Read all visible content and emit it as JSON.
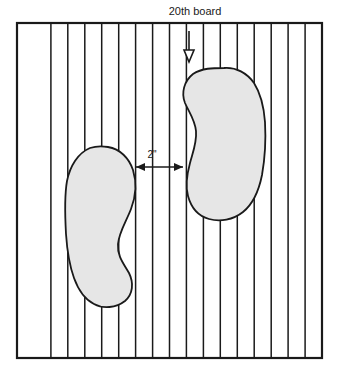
{
  "diagram": {
    "title_label": "20th board",
    "dimension_label": "2\"",
    "colors": {
      "footprint_fill": "#e6e6e6",
      "footprint_stroke": "#1a1a1a",
      "board_line": "#1a1a1a",
      "frame": "#1a1a1a",
      "background": "#ffffff",
      "text": "#1a1a1a"
    },
    "floor": {
      "name": "board-floor",
      "frame": {
        "x": 17,
        "y": 23,
        "width": 305,
        "height": 335
      },
      "board_count": 18,
      "divider_count": 17,
      "board_width": 16.94,
      "divider_x": [
        33.9,
        50.8,
        67.8,
        84.7,
        101.7,
        118.6,
        135.6,
        152.5,
        169.4,
        186.4,
        203.3,
        220.3,
        237.2,
        254.2,
        271.1,
        288.1,
        305.0
      ]
    },
    "callout_arrow": {
      "name": "twentieth-board-pointer",
      "x": 189,
      "y_start": 31,
      "y_end": 62,
      "head_width": 10,
      "head_height": 12
    },
    "title_text_pos": {
      "x": 195,
      "y": 15
    },
    "dimension": {
      "name": "gap-dimension",
      "y": 167,
      "x_left": 136,
      "x_right": 183,
      "label_x": 152,
      "label_y": 158
    },
    "footprints": [
      {
        "name": "left-footprint",
        "foot": "left",
        "path": "M 108 147 C 120 149 129 158 133 170 C 137 183 136 196 131 209 C 126 222 119 232 118 244 C 117 256 124 264 129 273 C 134 283 133 294 125 301 C 116 308 103 309 94 304 C 84 299 78 289 74 278 C 69 264 67 249 66 234 C 65 216 64 198 67 181 C 70 166 78 153 90 148 C 96 146 102 146 108 147 Z"
      },
      {
        "name": "right-footprint",
        "foot": "right",
        "path": "M 224 68 C 236 67 247 73 254 83 C 261 94 264 108 265 122 C 266 140 265 158 262 175 C 259 190 253 204 243 212 C 233 220 220 222 209 219 C 198 216 191 207 188 196 C 185 185 187 174 190 163 C 193 152 197 142 196 131 C 195 120 189 112 185 103 C 181 93 184 81 193 74 C 202 68 213 68 224 68 Z"
      }
    ]
  }
}
